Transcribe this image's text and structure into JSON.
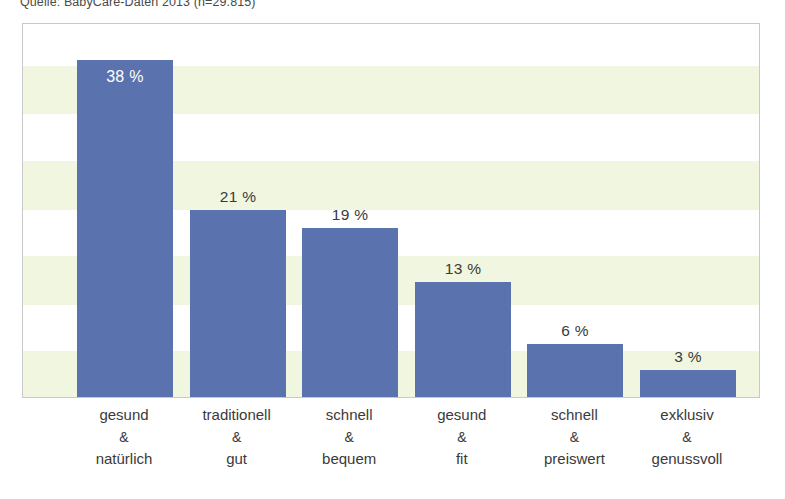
{
  "source_note": "Quelle: BabyCare-Daten 2013 (n=29.815)",
  "colors": {
    "bar": "#5a72ad",
    "band": "#f1f6e0",
    "frame_border": "#c9c9c9",
    "inside_label": "#ffffff",
    "outside_label": "#3a3a3a"
  },
  "chart_data": {
    "type": "bar",
    "title": "",
    "subtitle": "",
    "xlabel": "",
    "ylabel": "",
    "ylim": [
      0,
      42
    ],
    "grid": "horizontal-bands",
    "legend": "none",
    "categories": [
      "gesund & natürlich",
      "traditionell & gut",
      "schnell & bequem",
      "gesund & fit",
      "schnell & preiswert",
      "exklusiv & genussvoll"
    ],
    "values": [
      38,
      21,
      19,
      13,
      6,
      3
    ],
    "value_labels": [
      "38 %",
      "21 %",
      "19 %",
      "13 %",
      "6 %",
      "3 %"
    ],
    "label_placement": [
      "inside",
      "above",
      "above",
      "above",
      "above",
      "above"
    ],
    "category_lines": [
      [
        "gesund",
        "&",
        "natürlich"
      ],
      [
        "traditionell",
        "&",
        "gut"
      ],
      [
        "schnell",
        "&",
        "bequem"
      ],
      [
        "gesund",
        "&",
        "fit"
      ],
      [
        "schnell",
        "&",
        "preiswert"
      ],
      [
        "exklusiv",
        "&",
        "genussvoll"
      ]
    ]
  }
}
